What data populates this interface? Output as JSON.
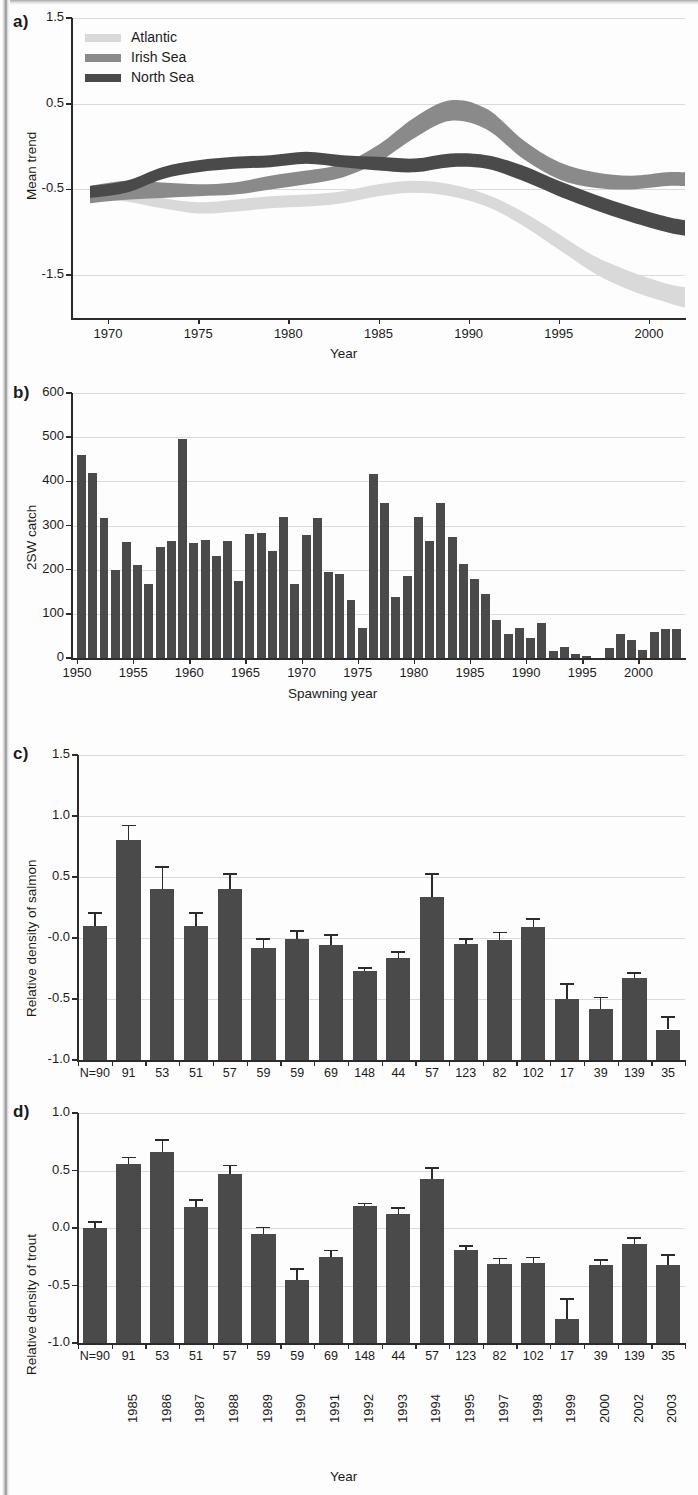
{
  "figure": {
    "panels": [
      "a)",
      "b)",
      "c)",
      "d)"
    ]
  },
  "chart_data": [
    {
      "panel": "a)",
      "type": "area",
      "title": "",
      "xlabel": "Year",
      "ylabel": "Mean trend",
      "xlim": [
        1968,
        2002
      ],
      "ylim": [
        -2.0,
        1.5
      ],
      "xticks": [
        "1970",
        "1975",
        "1980",
        "1985",
        "1990",
        "1995",
        "2000"
      ],
      "xtick_values": [
        1970,
        1975,
        1980,
        1985,
        1990,
        1995,
        2000
      ],
      "yticks": [
        "1.5",
        "0.5",
        "-0.5",
        "-1.5"
      ],
      "ytick_values": [
        1.5,
        0.5,
        -0.5,
        -1.5
      ],
      "grid": true,
      "legend_position": "top-left",
      "legend": [
        "Atlantic",
        "Irish Sea",
        "North Sea"
      ],
      "colors": {
        "Atlantic": "#d9d9d9",
        "Irish Sea": "#8a8a8a",
        "North Sea": "#4a4a4a"
      },
      "series": [
        {
          "name": "Atlantic",
          "color": "#d9d9d9",
          "x": [
            1969,
            1971,
            1973,
            1975,
            1977,
            1979,
            1981,
            1983,
            1985,
            1987,
            1989,
            1991,
            1993,
            1995,
            1997,
            1999,
            2001,
            2002
          ],
          "upper": [
            -0.5,
            -0.52,
            -0.6,
            -0.65,
            -0.62,
            -0.58,
            -0.56,
            -0.52,
            -0.44,
            -0.4,
            -0.44,
            -0.56,
            -0.76,
            -1.02,
            -1.28,
            -1.46,
            -1.6,
            -1.64
          ],
          "lower": [
            -0.62,
            -0.64,
            -0.72,
            -0.78,
            -0.76,
            -0.72,
            -0.7,
            -0.66,
            -0.58,
            -0.54,
            -0.58,
            -0.7,
            -0.92,
            -1.2,
            -1.48,
            -1.68,
            -1.82,
            -1.88
          ]
        },
        {
          "name": "Irish Sea",
          "color": "#8a8a8a",
          "x": [
            1969,
            1971,
            1973,
            1975,
            1977,
            1979,
            1981,
            1983,
            1985,
            1987,
            1989,
            1991,
            1993,
            1995,
            1997,
            1999,
            2001,
            2002
          ],
          "upper": [
            -0.46,
            -0.4,
            -0.42,
            -0.44,
            -0.42,
            -0.34,
            -0.28,
            -0.2,
            0.02,
            0.34,
            0.54,
            0.44,
            0.08,
            -0.18,
            -0.3,
            -0.34,
            -0.3,
            -0.3
          ],
          "lower": [
            -0.66,
            -0.62,
            -0.6,
            -0.58,
            -0.56,
            -0.5,
            -0.44,
            -0.36,
            -0.18,
            0.1,
            0.3,
            0.2,
            -0.14,
            -0.38,
            -0.48,
            -0.5,
            -0.46,
            -0.46
          ]
        },
        {
          "name": "North Sea",
          "color": "#4a4a4a",
          "x": [
            1969,
            1971,
            1973,
            1975,
            1977,
            1979,
            1981,
            1983,
            1985,
            1987,
            1989,
            1991,
            1993,
            1995,
            1997,
            1999,
            2001,
            2002
          ],
          "upper": [
            -0.46,
            -0.4,
            -0.24,
            -0.16,
            -0.12,
            -0.1,
            -0.06,
            -0.1,
            -0.12,
            -0.14,
            -0.08,
            -0.1,
            -0.22,
            -0.4,
            -0.56,
            -0.7,
            -0.82,
            -0.86
          ],
          "lower": [
            -0.6,
            -0.54,
            -0.38,
            -0.3,
            -0.26,
            -0.24,
            -0.2,
            -0.24,
            -0.28,
            -0.3,
            -0.24,
            -0.26,
            -0.4,
            -0.58,
            -0.74,
            -0.88,
            -1.0,
            -1.04
          ]
        }
      ]
    },
    {
      "panel": "b)",
      "type": "bar",
      "title": "",
      "xlabel": "Spawning year",
      "ylabel": "2SW catch",
      "ylim": [
        0,
        600
      ],
      "yticks": [
        "0",
        "100",
        "200",
        "300",
        "400",
        "500",
        "600"
      ],
      "ytick_values": [
        0,
        100,
        200,
        300,
        400,
        500,
        600
      ],
      "xticks": [
        "1950",
        "1955",
        "1960",
        "1965",
        "1970",
        "1975",
        "1980",
        "1985",
        "1990",
        "1995",
        "2000"
      ],
      "xtick_values": [
        1950,
        1955,
        1960,
        1965,
        1970,
        1975,
        1980,
        1985,
        1990,
        1995,
        2000
      ],
      "grid": true,
      "bar_color": "#4a4a4a",
      "categories": [
        1950,
        1951,
        1952,
        1953,
        1954,
        1955,
        1956,
        1957,
        1958,
        1959,
        1960,
        1961,
        1962,
        1963,
        1964,
        1965,
        1966,
        1967,
        1968,
        1969,
        1970,
        1971,
        1972,
        1973,
        1974,
        1975,
        1976,
        1977,
        1978,
        1979,
        1980,
        1981,
        1982,
        1983,
        1984,
        1985,
        1986,
        1987,
        1988,
        1989,
        1990,
        1991,
        1992,
        1993,
        1994,
        1995,
        1996,
        1997,
        1998,
        1999,
        2000,
        2001,
        2002,
        2003
      ],
      "values": [
        460,
        420,
        317,
        200,
        262,
        210,
        167,
        252,
        266,
        496,
        261,
        267,
        230,
        264,
        175,
        280,
        283,
        242,
        320,
        167,
        278,
        317,
        194,
        190,
        131,
        68,
        416,
        350,
        139,
        186,
        320,
        266,
        350,
        274,
        212,
        180,
        144,
        86,
        55,
        68,
        45,
        80,
        15,
        25,
        8,
        5,
        0,
        22,
        55,
        40,
        18,
        58,
        65,
        66
      ]
    },
    {
      "panel": "c)",
      "type": "bar",
      "title": "",
      "xlabel": "",
      "ylabel": "Relative density of salmon",
      "ylim": [
        -1.0,
        1.5
      ],
      "yticks": [
        "1.5",
        "1.0",
        "0.5",
        "-0.0",
        "-0.5",
        "-1.0"
      ],
      "ytick_values": [
        1.5,
        1.0,
        0.5,
        0.0,
        -0.5,
        -1.0
      ],
      "grid": true,
      "bar_color": "#4a4a4a",
      "n_prefix": "N=",
      "n_values": [
        "90",
        "91",
        "53",
        "51",
        "57",
        "59",
        "59",
        "69",
        "148",
        "44",
        "57",
        "123",
        "82",
        "102",
        "17",
        "39",
        "139",
        "35"
      ],
      "categories": [
        "1985",
        "1986",
        "1987",
        "1988",
        "1989",
        "1990",
        "1991",
        "1992",
        "1993",
        "1994",
        "1995",
        "1997",
        "1998",
        "1999",
        "2000",
        "2002",
        "2003",
        "2004"
      ],
      "values": [
        0.1,
        0.8,
        0.4,
        0.1,
        0.4,
        -0.08,
        -0.005,
        -0.06,
        -0.27,
        -0.16,
        0.34,
        -0.05,
        -0.02,
        0.09,
        -0.5,
        -0.58,
        -0.33,
        -0.75
      ],
      "errors": [
        0.11,
        0.13,
        0.19,
        0.11,
        0.13,
        0.08,
        0.07,
        0.09,
        0.03,
        0.05,
        0.19,
        0.05,
        0.07,
        0.07,
        0.13,
        0.1,
        0.05,
        0.11
      ]
    },
    {
      "panel": "d)",
      "type": "bar",
      "title": "",
      "xlabel": "Year",
      "ylabel": "Relative density of trout",
      "ylim": [
        -1.0,
        1.0
      ],
      "yticks": [
        "1.0",
        "0.5",
        "0.0",
        "-0.5",
        "-1.0"
      ],
      "ytick_values": [
        1.0,
        0.5,
        0.0,
        -0.5,
        -1.0
      ],
      "grid": true,
      "bar_color": "#4a4a4a",
      "n_prefix": "N=",
      "n_values": [
        "90",
        "91",
        "53",
        "51",
        "57",
        "59",
        "59",
        "69",
        "148",
        "44",
        "57",
        "123",
        "82",
        "102",
        "17",
        "39",
        "139",
        "35"
      ],
      "categories": [
        "1985",
        "1986",
        "1987",
        "1988",
        "1989",
        "1990",
        "1991",
        "1992",
        "1993",
        "1994",
        "1995",
        "1997",
        "1998",
        "1999",
        "2000",
        "2002",
        "2003",
        "2004"
      ],
      "values": [
        0.0,
        0.56,
        0.66,
        0.18,
        0.47,
        -0.05,
        -0.45,
        -0.25,
        0.19,
        0.12,
        0.43,
        -0.19,
        -0.31,
        -0.3,
        -0.79,
        -0.32,
        -0.14,
        -0.32
      ],
      "errors": [
        0.06,
        0.06,
        0.11,
        0.07,
        0.08,
        0.06,
        0.1,
        0.06,
        0.03,
        0.06,
        0.1,
        0.04,
        0.05,
        0.05,
        0.18,
        0.05,
        0.06,
        0.09
      ]
    }
  ]
}
